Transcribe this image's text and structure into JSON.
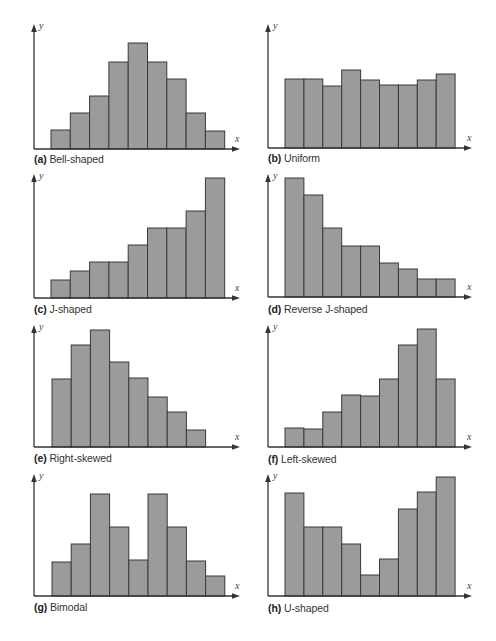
{
  "figure": {
    "bar_fill": "#9b9b9b",
    "bar_stroke": "#3a3a3a",
    "axis_color": "#333333",
    "background": "#ffffff"
  },
  "chart_data": [
    {
      "id": "a",
      "type": "bar",
      "title": "Bell-shaped",
      "letter": "(a)",
      "xlabel": "x",
      "ylabel": "y",
      "categories": [
        1,
        2,
        3,
        4,
        5,
        6,
        7,
        8,
        9
      ],
      "values": [
        19,
        36,
        53,
        87,
        106,
        87,
        70,
        36,
        18
      ],
      "grid": false,
      "layout": {
        "axis_x": 34,
        "axis_y": 149,
        "y_top": 24,
        "x_end": 240,
        "bar_start": 51,
        "bar_w": 19.3,
        "label_y": 151,
        "caption_y": 153
      }
    },
    {
      "id": "b",
      "type": "bar",
      "title": "Uniform",
      "letter": "(b)",
      "xlabel": "x",
      "ylabel": "y",
      "categories": [
        1,
        2,
        3,
        4,
        5,
        6,
        7,
        8,
        9
      ],
      "values": [
        69,
        69,
        62,
        78,
        68,
        63,
        63,
        68,
        74
      ],
      "grid": false,
      "layout": {
        "axis_x": 268,
        "axis_y": 148,
        "y_top": 24,
        "x_end": 472,
        "bar_start": 285,
        "bar_w": 18.9,
        "label_y": 150,
        "caption_y": 152
      }
    },
    {
      "id": "c",
      "type": "bar",
      "title": "J-shaped",
      "letter": "(c)",
      "xlabel": "x",
      "ylabel": "y",
      "categories": [
        1,
        2,
        3,
        4,
        5,
        6,
        7,
        8,
        9
      ],
      "values": [
        18,
        27,
        36,
        36,
        53,
        70,
        70,
        87,
        120
      ],
      "grid": false,
      "layout": {
        "axis_x": 34,
        "axis_y": 298,
        "y_top": 174,
        "x_end": 240,
        "bar_start": 51,
        "bar_w": 19.3,
        "label_y": 300,
        "caption_y": 303
      }
    },
    {
      "id": "d",
      "type": "bar",
      "title": "Reverse J-shaped",
      "letter": "(d)",
      "xlabel": "x",
      "ylabel": "y",
      "categories": [
        1,
        2,
        3,
        4,
        5,
        6,
        7,
        8,
        9
      ],
      "values": [
        119,
        102,
        69,
        51,
        51,
        34,
        28,
        18,
        18
      ],
      "grid": false,
      "layout": {
        "axis_x": 268,
        "axis_y": 297,
        "y_top": 174,
        "x_end": 472,
        "bar_start": 285,
        "bar_w": 18.9,
        "label_y": 299,
        "caption_y": 303
      }
    },
    {
      "id": "e",
      "type": "bar",
      "title": "Right-skewed",
      "letter": "(e)",
      "xlabel": "x",
      "ylabel": "y",
      "categories": [
        1,
        2,
        3,
        4,
        5,
        6,
        7,
        8
      ],
      "values": [
        68,
        102,
        117,
        85,
        69,
        50,
        35,
        17
      ],
      "grid": false,
      "layout": {
        "axis_x": 34,
        "axis_y": 447,
        "y_top": 325,
        "x_end": 240,
        "bar_start": 52,
        "bar_w": 19.2,
        "label_y": 449,
        "caption_y": 452
      }
    },
    {
      "id": "f",
      "type": "bar",
      "title": "Left-skewed",
      "letter": "(f)",
      "xlabel": "x",
      "ylabel": "y",
      "categories": [
        1,
        2,
        3,
        4,
        5,
        6,
        7,
        8,
        9
      ],
      "values": [
        19,
        18,
        35,
        52,
        51,
        68,
        102,
        118,
        68
      ],
      "grid": false,
      "layout": {
        "axis_x": 268,
        "axis_y": 447,
        "y_top": 325,
        "x_end": 472,
        "bar_start": 285,
        "bar_w": 18.9,
        "label_y": 449,
        "caption_y": 453
      }
    },
    {
      "id": "g",
      "type": "bar",
      "title": "Bimodal",
      "letter": "(g)",
      "xlabel": "x",
      "ylabel": "y",
      "categories": [
        1,
        2,
        3,
        4,
        5,
        6,
        7,
        8,
        9
      ],
      "values": [
        34,
        52,
        102,
        69,
        36,
        102,
        69,
        35,
        20
      ],
      "grid": false,
      "layout": {
        "axis_x": 34,
        "axis_y": 596,
        "y_top": 474,
        "x_end": 240,
        "bar_start": 52,
        "bar_w": 19.2,
        "label_y": 598,
        "caption_y": 601
      }
    },
    {
      "id": "h",
      "type": "bar",
      "title": "U-shaped",
      "letter": "(h)",
      "xlabel": "x",
      "ylabel": "y",
      "categories": [
        1,
        2,
        3,
        4,
        5,
        6,
        7,
        8,
        9
      ],
      "values": [
        103,
        69,
        69,
        52,
        21,
        37,
        87,
        104,
        119
      ],
      "grid": false,
      "layout": {
        "axis_x": 268,
        "axis_y": 596,
        "y_top": 474,
        "x_end": 472,
        "bar_start": 285,
        "bar_w": 18.9,
        "label_y": 598,
        "caption_y": 602
      }
    }
  ]
}
